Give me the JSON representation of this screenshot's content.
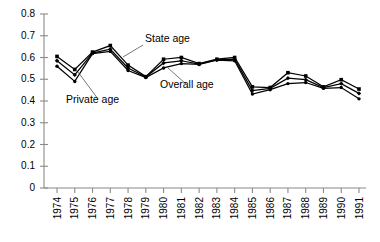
{
  "chart_data": {
    "type": "line",
    "title": "",
    "xlabel": "",
    "ylabel": "",
    "grid": false,
    "legend_position": "inline-annotations",
    "categories": [
      "1974",
      "1975",
      "1976",
      "1977",
      "1978",
      "1979",
      "1980",
      "1981",
      "1982",
      "1983",
      "1984",
      "1985",
      "1986",
      "1987",
      "1988",
      "1989",
      "1990",
      "1991"
    ],
    "ylim": [
      0,
      0.8
    ],
    "yticks": [
      "0",
      "0.1",
      "0.2",
      "0.3",
      "0.4",
      "0.5",
      "0.6",
      "0.7",
      "0.8"
    ],
    "ytick_values": [
      0,
      0.1,
      0.2,
      0.3,
      0.4,
      0.5,
      0.6,
      0.7,
      0.8
    ],
    "series": [
      {
        "name": "State age",
        "values": [
          0.605,
          0.545,
          0.625,
          0.655,
          0.565,
          0.512,
          0.592,
          0.6,
          0.572,
          0.592,
          0.6,
          0.465,
          0.462,
          0.53,
          0.515,
          0.465,
          0.498,
          0.455
        ]
      },
      {
        "name": "Overall age",
        "values": [
          0.585,
          0.52,
          0.62,
          0.638,
          0.552,
          0.51,
          0.575,
          0.585,
          0.57,
          0.59,
          0.592,
          0.448,
          0.458,
          0.505,
          0.498,
          0.462,
          0.48,
          0.435
        ]
      },
      {
        "name": "Private age",
        "values": [
          0.56,
          0.49,
          0.618,
          0.628,
          0.54,
          0.508,
          0.552,
          0.572,
          0.568,
          0.588,
          0.585,
          0.432,
          0.452,
          0.48,
          0.485,
          0.458,
          0.462,
          0.41
        ]
      }
    ],
    "annotations": [
      {
        "label": "State age",
        "text_x": 145,
        "text_y": 42,
        "leader_x1": 143,
        "leader_y1": 45,
        "leader_x2": 123,
        "leader_y2": 57
      },
      {
        "label": "Private age",
        "text_x": 66,
        "text_y": 103,
        "leader_x1": 98,
        "leader_y1": 99,
        "leader_x2": 78,
        "leader_y2": 72
      },
      {
        "label": "Overall age",
        "text_x": 160,
        "text_y": 88,
        "leader_x1": 186,
        "leader_y1": 84,
        "leader_x2": 168,
        "leader_y2": 68
      }
    ],
    "colors": {
      "series_stroke": "#000000",
      "axis": "#8a8a8a",
      "leader": "#555555",
      "background": "#ffffff"
    }
  }
}
